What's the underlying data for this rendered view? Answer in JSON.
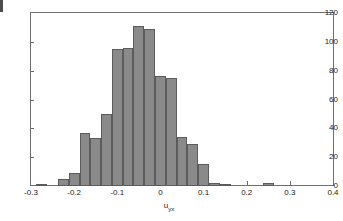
{
  "figure": {
    "background_color": "#ffffff",
    "axes_color": "#6e6e6e",
    "bar_face_color": "#8a8a8a",
    "bar_edge_color": "#5c5c5c",
    "text_color": "#1a1a1a"
  },
  "axis": {
    "xlabel_base": "u",
    "xlabel_sub": "yx",
    "ylabel": "",
    "y_ticks": [
      0,
      20,
      40,
      60,
      80,
      100,
      120
    ],
    "y_tick_labels": [
      "0",
      "20",
      "40",
      "60",
      "80",
      "100",
      "120"
    ],
    "x_ticks": [
      -0.3,
      -0.2,
      -0.1,
      0,
      0.1,
      0.2,
      0.3,
      0.4
    ],
    "x_tick_labels": [
      "-0.3",
      "-0.2",
      "-0.1",
      "0",
      "0.1",
      "0.2",
      "0.3",
      "0.4"
    ]
  },
  "chart_data": {
    "type": "bar",
    "title": "",
    "subtitle": "",
    "xlabel": "u_yx",
    "ylabel": "",
    "xlim": [
      -0.3,
      0.4
    ],
    "ylim": [
      0,
      120
    ],
    "grid": false,
    "legend": null,
    "bin_width": 0.025,
    "bin_left_edges": [
      -0.2875,
      -0.2625,
      -0.2375,
      -0.2125,
      -0.1875,
      -0.1625,
      -0.1375,
      -0.1125,
      -0.0875,
      -0.0625,
      -0.0375,
      -0.0125,
      0.0125,
      0.0375,
      0.0625,
      0.0875,
      0.1125,
      0.1375,
      0.1625,
      0.1875,
      0.2125,
      0.2375,
      0.2625,
      0.2875,
      0.3125
    ],
    "categories": [
      "-0.2875",
      "-0.2625",
      "-0.2375",
      "-0.2125",
      "-0.1875",
      "-0.1625",
      "-0.1375",
      "-0.1125",
      "-0.0875",
      "-0.0625",
      "-0.0375",
      "-0.0125",
      "0.0125",
      "0.0375",
      "0.0625",
      "0.0875",
      "0.1125",
      "0.1375",
      "0.1625",
      "0.1875",
      "0.2125",
      "0.2375",
      "0.2625",
      "0.2875",
      "0.3125"
    ],
    "values": [
      1,
      0,
      5,
      9,
      37,
      33,
      50,
      95,
      96,
      111,
      109,
      76,
      75,
      34,
      29,
      15,
      2,
      1,
      0,
      0,
      0,
      2,
      0,
      0,
      0
    ]
  }
}
